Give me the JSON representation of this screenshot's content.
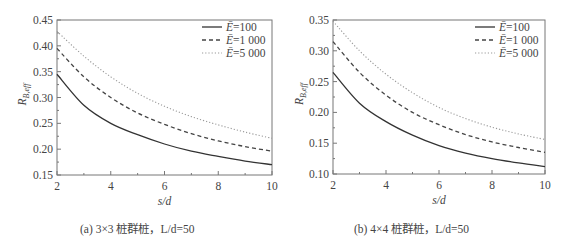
{
  "chart_data": [
    {
      "type": "line",
      "panel": "a",
      "caption": "(a) 3×3 桩群桩，L/d=50",
      "xlabel": "s/d",
      "ylabel": "R_B,eff",
      "xlim": [
        2,
        10
      ],
      "ylim": [
        0.15,
        0.45
      ],
      "xticks": [
        "2",
        "4",
        "6",
        "8",
        "10"
      ],
      "yticks": [
        "0.15",
        "0.20",
        "0.25",
        "0.30",
        "0.35",
        "0.40",
        "0.45"
      ],
      "grid": false,
      "legend_position": "upper right",
      "x": [
        2,
        3,
        4,
        5,
        6,
        7,
        8,
        9,
        10
      ],
      "series": [
        {
          "name": "Ē=100",
          "style": "solid",
          "values": [
            0.345,
            0.285,
            0.25,
            0.228,
            0.21,
            0.196,
            0.186,
            0.177,
            0.17
          ]
        },
        {
          "name": "Ē=1 000",
          "style": "dashed",
          "values": [
            0.395,
            0.34,
            0.3,
            0.27,
            0.248,
            0.23,
            0.216,
            0.205,
            0.196
          ]
        },
        {
          "name": "Ē=5 000",
          "style": "dotted",
          "values": [
            0.428,
            0.38,
            0.34,
            0.308,
            0.283,
            0.263,
            0.247,
            0.233,
            0.221
          ]
        }
      ]
    },
    {
      "type": "line",
      "panel": "b",
      "caption": "(b) 4×4 桩群桩，L/d=50",
      "xlabel": "s/d",
      "ylabel": "R_B,eff",
      "xlim": [
        2,
        10
      ],
      "ylim": [
        0.1,
        0.35
      ],
      "xticks": [
        "2",
        "4",
        "6",
        "8",
        "10"
      ],
      "yticks": [
        "0.10",
        "0.15",
        "0.20",
        "0.25",
        "0.30",
        "0.35"
      ],
      "grid": false,
      "legend_position": "upper right",
      "x": [
        2,
        3,
        4,
        5,
        6,
        7,
        8,
        9,
        10
      ],
      "series": [
        {
          "name": "Ē=100",
          "style": "solid",
          "values": [
            0.265,
            0.215,
            0.185,
            0.163,
            0.146,
            0.134,
            0.125,
            0.118,
            0.112
          ]
        },
        {
          "name": "Ē=1 000",
          "style": "dashed",
          "values": [
            0.315,
            0.265,
            0.228,
            0.2,
            0.18,
            0.164,
            0.152,
            0.143,
            0.135
          ]
        },
        {
          "name": "Ē=5 000",
          "style": "dotted",
          "values": [
            0.348,
            0.3,
            0.262,
            0.232,
            0.208,
            0.19,
            0.176,
            0.165,
            0.156
          ]
        }
      ]
    }
  ],
  "panels": {
    "a": {
      "caption": "(a) 3×3 桩群桩，L/d=50",
      "xlabel": "s/d",
      "ylabel_main": "R",
      "ylabel_sub": "B,eff",
      "legend": [
        "Ē=100",
        "Ē=1 000",
        "Ē=5 000"
      ]
    },
    "b": {
      "caption": "(b) 4×4 桩群桩，L/d=50",
      "xlabel": "s/d",
      "ylabel_main": "R",
      "ylabel_sub": "B,eff",
      "legend": [
        "Ē=100",
        "Ē=1 000",
        "Ē=5 000"
      ]
    }
  },
  "colors": {
    "solid": "#333333",
    "dashed": "#444444",
    "dotted": "#999999",
    "frame": "#777777"
  }
}
